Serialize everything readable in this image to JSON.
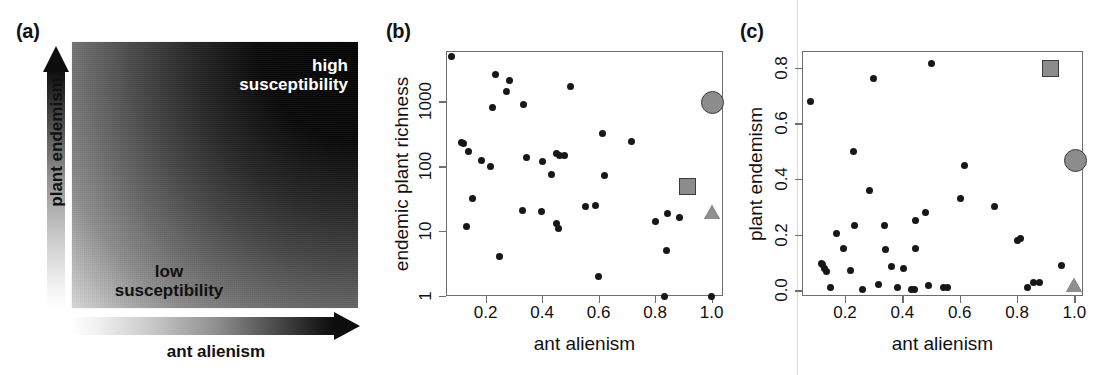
{
  "figure": {
    "panels": [
      {
        "id": "a",
        "label": "(a)"
      },
      {
        "id": "b",
        "label": "(b)"
      },
      {
        "id": "c",
        "label": "(c)"
      }
    ]
  },
  "panel_a": {
    "label": "(a)",
    "y_axis_label": "plant endemism",
    "x_axis_label": "ant alienism",
    "high_label": "high\nsusceptibility",
    "high_label_line1": "high",
    "high_label_line2": "susceptibility",
    "low_label_line1": "low",
    "low_label_line2": "susceptibility",
    "gradient_dark_corner": "top-right",
    "gradient_light_corner": "bottom-left",
    "colors": {
      "dark": "#050505",
      "light": "#d8d8d8",
      "high_text": "#ffffff",
      "low_text": "#111111"
    }
  },
  "chart_data": [
    {
      "panel": "b",
      "type": "scatter",
      "title": "(b)",
      "xlabel": "ant alienism",
      "ylabel": "endemic plant richness",
      "xlim": [
        0.06,
        1.04
      ],
      "ylim": [
        1,
        6000
      ],
      "yscale": "log",
      "xscale": "linear",
      "grid": false,
      "legend": "none",
      "xticks": [
        0.2,
        0.4,
        0.6,
        0.8,
        1.0
      ],
      "xticklabels": [
        "0.2",
        "0.4",
        "0.6",
        "0.8",
        "1.0"
      ],
      "yticks": [
        1,
        10,
        100,
        1000
      ],
      "yticklabels": [
        "1",
        "10",
        "100",
        "1000"
      ],
      "series": [
        {
          "name": "islands",
          "marker": "filled-circle",
          "color": "#171717",
          "points": [
            [
              0.08,
              5000
            ],
            [
              0.235,
              2600
            ],
            [
              0.285,
              2100
            ],
            [
              0.275,
              1400
            ],
            [
              0.225,
              820
            ],
            [
              0.335,
              900
            ],
            [
              0.5,
              1700
            ],
            [
              0.115,
              230
            ],
            [
              0.122,
              225
            ],
            [
              0.14,
              170
            ],
            [
              0.185,
              125
            ],
            [
              0.218,
              100
            ],
            [
              0.345,
              135
            ],
            [
              0.4,
              120
            ],
            [
              0.45,
              155
            ],
            [
              0.462,
              145
            ],
            [
              0.48,
              145
            ],
            [
              0.612,
              320
            ],
            [
              0.718,
              240
            ],
            [
              0.432,
              75
            ],
            [
              0.622,
              72
            ],
            [
              0.155,
              32
            ],
            [
              0.33,
              21
            ],
            [
              0.398,
              20
            ],
            [
              0.552,
              24
            ],
            [
              0.588,
              25
            ],
            [
              0.845,
              19
            ],
            [
              0.8,
              14
            ],
            [
              0.885,
              16
            ],
            [
              0.132,
              12
            ],
            [
              0.452,
              13
            ],
            [
              0.458,
              11
            ],
            [
              0.84,
              5
            ],
            [
              0.248,
              4
            ],
            [
              0.598,
              2
            ],
            [
              0.832,
              1
            ],
            [
              1.0,
              1
            ]
          ]
        },
        {
          "name": "highlight-circle",
          "marker": "gray-circle",
          "color": "#8c8c8c",
          "points": [
            [
              1.0,
              1000
            ]
          ]
        },
        {
          "name": "highlight-square",
          "marker": "gray-square",
          "color": "#8c8c8c",
          "points": [
            [
              0.912,
              50
            ]
          ]
        },
        {
          "name": "highlight-triangle",
          "marker": "gray-triangle",
          "color": "#8f8f8f",
          "points": [
            [
              1.0,
              20
            ]
          ]
        }
      ]
    },
    {
      "panel": "c",
      "type": "scatter",
      "title": "(c)",
      "xlabel": "ant alienism",
      "ylabel": "plant endemism",
      "xlim": [
        0.05,
        1.03
      ],
      "ylim": [
        -0.02,
        0.86
      ],
      "yscale": "linear",
      "xscale": "linear",
      "grid": false,
      "legend": "none",
      "xticks": [
        0.2,
        0.4,
        0.6,
        0.8,
        1.0
      ],
      "xticklabels": [
        "0.2",
        "0.4",
        "0.6",
        "0.8",
        "1.0"
      ],
      "yticks": [
        0.0,
        0.2,
        0.4,
        0.6,
        0.8
      ],
      "yticklabels": [
        "0.0",
        "0.2",
        "0.4",
        "0.6",
        "0.8"
      ],
      "series": [
        {
          "name": "islands",
          "marker": "filled-circle",
          "color": "#171717",
          "points": [
            [
              0.08,
              0.68
            ],
            [
              0.298,
              0.76
            ],
            [
              0.5,
              0.815
            ],
            [
              0.228,
              0.5
            ],
            [
              0.618,
              0.45
            ],
            [
              0.287,
              0.36
            ],
            [
              0.602,
              0.332
            ],
            [
              0.722,
              0.303
            ],
            [
              0.482,
              0.28
            ],
            [
              0.445,
              0.252
            ],
            [
              0.232,
              0.232
            ],
            [
              0.337,
              0.232
            ],
            [
              0.172,
              0.203
            ],
            [
              0.803,
              0.18
            ],
            [
              0.193,
              0.15
            ],
            [
              0.34,
              0.148
            ],
            [
              0.447,
              0.15
            ],
            [
              0.812,
              0.185
            ],
            [
              0.118,
              0.097
            ],
            [
              0.123,
              0.092
            ],
            [
              0.13,
              0.08
            ],
            [
              0.134,
              0.068
            ],
            [
              0.362,
              0.085
            ],
            [
              0.405,
              0.078
            ],
            [
              0.22,
              0.07
            ],
            [
              0.955,
              0.088
            ],
            [
              0.148,
              0.012
            ],
            [
              0.262,
              0.003
            ],
            [
              0.318,
              0.02
            ],
            [
              0.382,
              0.01
            ],
            [
              0.432,
              0.005
            ],
            [
              0.441,
              0.004
            ],
            [
              0.492,
              0.018
            ],
            [
              0.545,
              0.01
            ],
            [
              0.558,
              0.01
            ],
            [
              0.838,
              0.012
            ],
            [
              0.858,
              0.028
            ],
            [
              0.878,
              0.028
            ],
            [
              1.0,
              0.01
            ]
          ]
        },
        {
          "name": "highlight-circle",
          "marker": "gray-circle",
          "color": "#8c8c8c",
          "points": [
            [
              1.0,
              0.47
            ]
          ]
        },
        {
          "name": "highlight-square",
          "marker": "gray-square",
          "color": "#8c8c8c",
          "points": [
            [
              0.912,
              0.8
            ]
          ]
        },
        {
          "name": "highlight-triangle",
          "marker": "gray-triangle",
          "color": "#8f8f8f",
          "points": [
            [
              1.0,
              0.02
            ]
          ]
        }
      ]
    }
  ]
}
